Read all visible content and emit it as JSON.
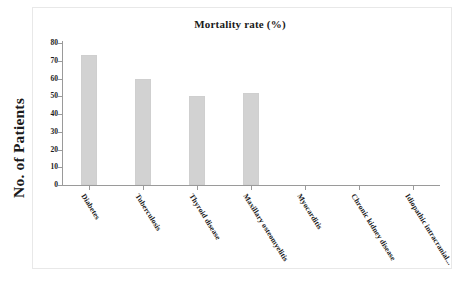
{
  "chart_data": {
    "type": "bar",
    "title": "Mortality rate (%)",
    "xlabel": "",
    "ylabel": "No. of Patients",
    "ylim": [
      0,
      80
    ],
    "yticks": [
      0,
      10,
      20,
      30,
      40,
      50,
      60,
      70,
      80
    ],
    "ytick_labels": [
      "0",
      "10",
      "20",
      "30",
      "40",
      "50",
      "60",
      "70",
      "80"
    ],
    "grid": false,
    "legend": null,
    "bar_color": "#d2d2d2",
    "categories": [
      "Diabetes",
      "Tuberculosis",
      "Thyroid disease",
      "Maxillary osteomyelitis",
      "Myocarditis",
      "Chronic kidney disease",
      "Idiopathic intracranial..."
    ],
    "values": [
      73,
      60,
      50,
      52,
      0,
      0,
      0
    ]
  }
}
